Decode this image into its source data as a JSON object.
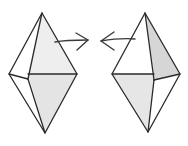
{
  "diagram": {
    "colors": {
      "background": "#ffffff",
      "stroke": "#2a2a2a",
      "light_face": "#ececec",
      "dark_face": "#d6d6d6"
    },
    "shapes": [
      {
        "name": "left-bipyramid",
        "arrow_direction": "right",
        "vertices": {
          "apex": [
            42,
            13
          ],
          "bottom": [
            45,
            133
          ],
          "left": [
            9,
            74
          ],
          "right": [
            77,
            74
          ],
          "front": [
            28,
            79
          ]
        }
      },
      {
        "name": "right-bipyramid",
        "arrow_direction": "left",
        "vertices": {
          "apex": [
            145,
            13
          ],
          "bottom": [
            148,
            132
          ],
          "left": [
            112,
            74
          ],
          "right": [
            180,
            74
          ],
          "front": [
            154,
            80
          ]
        }
      }
    ]
  }
}
